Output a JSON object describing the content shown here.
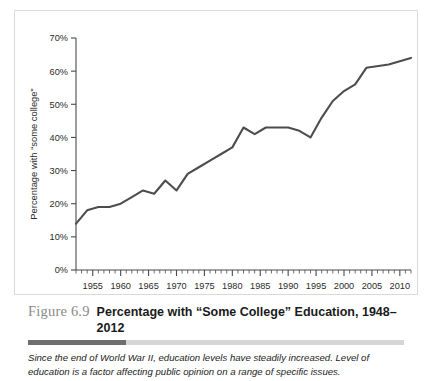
{
  "figure": {
    "number": "Figure 6.9",
    "title": "Percentage with “Some College” Education, 1948–2012",
    "note": "Since the end of World War II, education levels have steadily increased. Level of education is a factor affecting public opinion on a range of specific issues."
  },
  "colors": {
    "line": "#4d4d4d",
    "axis": "#4a4a4a",
    "frame": "#d9d9d9",
    "rule_dark": "#6e6e6e",
    "rule_light": "#d6d6d6",
    "figure_number": "#8a8a8a"
  },
  "chart_data": {
    "type": "line",
    "title": "Percentage with “Some College” Education, 1948–2012",
    "xlabel": "",
    "ylabel": "Percentage with “some college”",
    "xlim": [
      1952,
      2012
    ],
    "ylim": [
      0,
      70
    ],
    "grid": false,
    "legend": null,
    "y_ticks": [
      0,
      10,
      20,
      30,
      40,
      50,
      60,
      70
    ],
    "y_tick_labels": [
      "0%",
      "10%",
      "20%",
      "30%",
      "40%",
      "50%",
      "60%",
      "70%"
    ],
    "x_ticks": [
      1955,
      1960,
      1965,
      1970,
      1975,
      1980,
      1985,
      1990,
      1995,
      2000,
      2005,
      2010
    ],
    "x_tick_labels": [
      "1955",
      "1960",
      "1965",
      "1970",
      "1975",
      "1980",
      "1985",
      "1990",
      "1995",
      "2000",
      "2005",
      "2010"
    ],
    "x_minor_tick_step": 1,
    "series": [
      {
        "name": "Percentage with “some college”",
        "x": [
          1952,
          1954,
          1956,
          1958,
          1960,
          1962,
          1964,
          1966,
          1968,
          1970,
          1972,
          1974,
          1976,
          1978,
          1980,
          1982,
          1984,
          1986,
          1988,
          1990,
          1992,
          1994,
          1996,
          1998,
          2000,
          2002,
          2004,
          2008,
          2012
        ],
        "values": [
          14,
          18,
          19,
          19,
          20,
          22,
          24,
          23,
          27,
          24,
          29,
          31,
          33,
          35,
          37,
          43,
          41,
          43,
          43,
          43,
          42,
          40,
          46,
          51,
          54,
          56,
          61,
          62,
          64
        ]
      }
    ]
  }
}
